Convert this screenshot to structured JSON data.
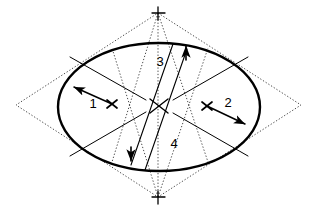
{
  "figure": {
    "background_color": "#ffffff",
    "stroke_color": "#000000",
    "width": 315,
    "height": 210
  },
  "labels": [
    {
      "id": "label-1",
      "text": "1",
      "x": 93,
      "y": 105,
      "meaning": "first conjugate semi-diameter"
    },
    {
      "id": "label-2",
      "text": "2",
      "x": 228,
      "y": 104,
      "meaning": "second conjugate semi-diameter"
    },
    {
      "id": "label-3",
      "text": "3",
      "x": 160,
      "y": 63,
      "meaning": "first conjugate diameter"
    },
    {
      "id": "label-4",
      "text": "4",
      "x": 174,
      "y": 145,
      "meaning": "second conjugate diameter"
    }
  ],
  "ellipse": {
    "center_x": 159,
    "center_y": 107,
    "radius_x": 101,
    "radius_y": 64,
    "stroke_width": 2.4,
    "stroke_color": "#000000",
    "fill": "none"
  },
  "rhombus": {
    "style": "dotted",
    "stroke_color": "#4a4a4a",
    "stroke_width": 1,
    "vertices": [
      {
        "name": "top",
        "x": 158,
        "y": 13
      },
      {
        "name": "right",
        "x": 301,
        "y": 105
      },
      {
        "name": "bottom",
        "x": 158,
        "y": 197
      },
      {
        "name": "left",
        "x": 16,
        "y": 105
      }
    ]
  },
  "dotted_construction_lines": [
    {
      "name": "top-to-left-cross",
      "x1": 158,
      "y1": 13,
      "x2": 112,
      "y2": 160
    },
    {
      "name": "top-to-right-cross",
      "x1": 158,
      "y1": 13,
      "x2": 207,
      "y2": 160
    },
    {
      "name": "bottom-to-left-cross",
      "x1": 158,
      "y1": 197,
      "x2": 112,
      "y2": 50
    },
    {
      "name": "bottom-to-right-cross",
      "x1": 158,
      "y1": 197,
      "x2": 207,
      "y2": 50
    }
  ],
  "cross_markers": [
    {
      "name": "center-cross",
      "x": 159,
      "y": 106,
      "size": 11,
      "weight": 1.3,
      "rotated": true
    },
    {
      "name": "left-conjugate-cross",
      "x": 112,
      "y": 104,
      "size": 7,
      "weight": 1.6,
      "rotated": true
    },
    {
      "name": "right-conjugate-cross",
      "x": 207,
      "y": 106,
      "size": 7,
      "weight": 1.6,
      "rotated": true
    },
    {
      "name": "top-vertex-cross",
      "x": 158,
      "y": 13,
      "size": 8,
      "weight": 1.2,
      "rotated": false
    },
    {
      "name": "bottom-vertex-cross",
      "x": 158,
      "y": 197,
      "size": 8,
      "weight": 1.2,
      "rotated": false
    }
  ],
  "dimension_arrows": [
    {
      "name": "dimension-arrow-1",
      "label": "1",
      "x1": 112,
      "y1": 104,
      "x2": 73,
      "y2": 86,
      "arrow_at": "end"
    },
    {
      "name": "dimension-arrow-2",
      "label": "2",
      "x1": 207,
      "y1": 106,
      "x2": 246,
      "y2": 125,
      "arrow_at": "end"
    },
    {
      "name": "dimension-arrow-3",
      "label": "3",
      "x1": 131,
      "y1": 161,
      "x2": 186,
      "y2": 45,
      "arrow_at": "both"
    },
    {
      "name": "dimension-arrow-4",
      "label": "4",
      "x1": 131,
      "y1": 161,
      "x2": 186,
      "y2": 45,
      "arrow_at": "both"
    }
  ],
  "chord_lines": [
    {
      "name": "upper-left-chord",
      "x1": 72,
      "y1": 58,
      "x2": 143,
      "y2": 99
    },
    {
      "name": "lower-left-chord",
      "x1": 72,
      "y1": 155,
      "x2": 143,
      "y2": 113
    },
    {
      "name": "upper-right-chord",
      "x1": 246,
      "y1": 58,
      "x2": 176,
      "y2": 99
    },
    {
      "name": "lower-right-chord",
      "x1": 246,
      "y1": 155,
      "x2": 176,
      "y2": 114
    }
  ],
  "conjugate_diameter_lines": [
    {
      "name": "diameter-line-3",
      "x1": 131,
      "y1": 163,
      "x2": 174,
      "y2": 44
    },
    {
      "name": "diameter-line-4",
      "x1": 144,
      "y1": 168,
      "x2": 188,
      "y2": 48
    }
  ]
}
